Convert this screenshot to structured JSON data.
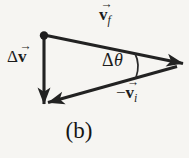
{
  "figure": {
    "caption": "(b)",
    "colors": {
      "ink": "#222222",
      "background": "#f6f5f2"
    },
    "labels": {
      "v_f": {
        "arrow": "→",
        "symbol": "v",
        "subscript": "f"
      },
      "delta_v": {
        "prefix": "Δ",
        "arrow": "→",
        "symbol": "v"
      },
      "delta_theta": {
        "delta": "Δ",
        "theta": "θ"
      },
      "neg_v_i": {
        "prefix": "−",
        "arrow": "→",
        "symbol": "v",
        "subscript": "i"
      }
    }
  }
}
